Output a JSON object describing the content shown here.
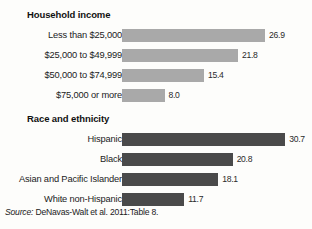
{
  "chart_data": {
    "type": "bar",
    "orientation": "horizontal",
    "title": "",
    "xlabel": "",
    "ylabel": "",
    "xlim": [
      0,
      32
    ],
    "grid": false,
    "legend": "none",
    "value_label_format": "one-decimal",
    "groups": [
      {
        "heading": "Household income",
        "bar_color": "#a9a9a9",
        "categories": [
          "Less than $25,000",
          "$25,000 to $49,999",
          "$50,000 to $74,999",
          "$75,000 or more"
        ],
        "values": [
          26.9,
          21.8,
          15.4,
          8.0
        ],
        "value_labels": [
          "26.9",
          "21.8",
          "15.4",
          "8.0"
        ]
      },
      {
        "heading": "Race and ethnicity",
        "bar_color": "#4a4a4a",
        "categories": [
          "Hispanic",
          "Black",
          "Asian and Pacific Islander",
          "White non-Hispanic"
        ],
        "values": [
          30.7,
          20.8,
          18.1,
          11.7
        ],
        "value_labels": [
          "30.7",
          "20.8",
          "18.1",
          "11.7"
        ]
      }
    ]
  },
  "headings": {
    "income": "Household income",
    "race": "Race and ethnicity"
  },
  "rows": {
    "income": [
      {
        "label": "Less than $25,000",
        "value": "26.9"
      },
      {
        "label": "$25,000 to $49,999",
        "value": "21.8"
      },
      {
        "label": "$50,000 to $74,999",
        "value": "15.4"
      },
      {
        "label": "$75,000 or more",
        "value": "8.0"
      }
    ],
    "race": [
      {
        "label": "Hispanic",
        "value": "30.7"
      },
      {
        "label": "Black",
        "value": "20.8"
      },
      {
        "label": "Asian and Pacific Islander",
        "value": "18.1"
      },
      {
        "label": "White non-Hispanic",
        "value": "11.7"
      }
    ]
  },
  "source": {
    "lead": "Source:",
    "text": " DeNavas-Walt et al. 2011:Table 8."
  }
}
